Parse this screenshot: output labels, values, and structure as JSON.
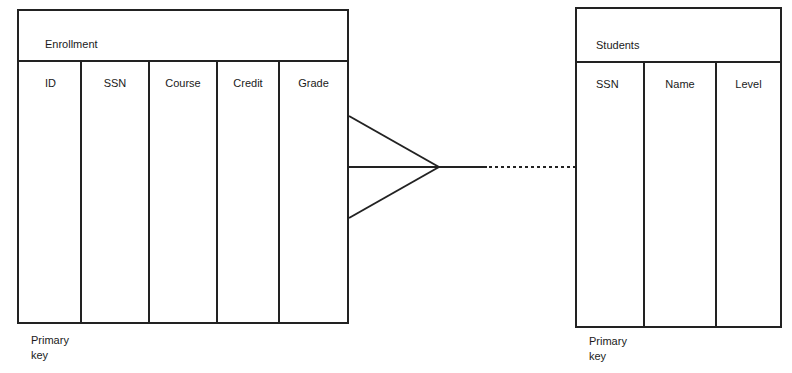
{
  "diagram": {
    "type": "entity-relationship",
    "entities": [
      {
        "name": "Enrollment",
        "columns": [
          "ID",
          "SSN",
          "Course",
          "Credit",
          "Grade"
        ],
        "primary_key_label": "Primary\nkey",
        "primary_key_column": "ID"
      },
      {
        "name": "Students",
        "columns": [
          "SSN",
          "Name",
          "Level"
        ],
        "primary_key_label": "Primary\nkey",
        "primary_key_column": "SSN"
      }
    ],
    "relationship": {
      "from": "Enrollment",
      "to": "Students",
      "from_cardinality": "many (crow's foot)",
      "to_cardinality": "one",
      "line_style": "solid then dashed (optional)"
    }
  },
  "enrollment": {
    "title": "Enrollment",
    "columns": [
      "ID",
      "SSN",
      "Course",
      "Credit",
      "Grade"
    ],
    "pk_line1": "Primary",
    "pk_line2": "key"
  },
  "students": {
    "title": "Students",
    "columns": [
      "SSN",
      "Name",
      "Level"
    ],
    "pk_line1": "Primary",
    "pk_line2": "key"
  },
  "colors": {
    "line": "#222222",
    "background": "#ffffff"
  }
}
